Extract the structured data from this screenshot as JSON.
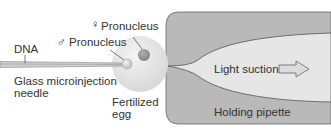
{
  "diagram": {
    "labels": {
      "dna": "DNA",
      "needle": "Glass microinjection\nneedle",
      "male_pronucleus": "Pronucleus",
      "female_pronucleus": "Pronucleus",
      "egg": "Fertilized\negg",
      "suction": "Light suction",
      "pipette": "Holding pipette"
    },
    "symbols": {
      "male": "♂",
      "female": "♀"
    },
    "colors": {
      "pipette_wall": "#b8b8b8",
      "pipette_lumen": "#e6e6e6",
      "egg": "#e4e4e4",
      "pronucleus": "#9a9a9a",
      "needle": "#aaaaaa",
      "text": "#333333"
    }
  }
}
